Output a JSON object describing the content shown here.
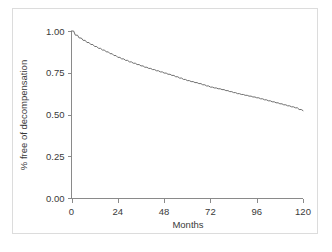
{
  "figure": {
    "background_color": "#ffffff",
    "frame_color": "#dcdcdc",
    "caption_fragment": ""
  },
  "chart_data": {
    "type": "line",
    "title": "",
    "subtitle": "",
    "xlabel": "Months",
    "ylabel": "% free of decompensation",
    "xlim": [
      0,
      120
    ],
    "ylim": [
      0.0,
      1.0
    ],
    "xticks": [
      0,
      24,
      48,
      72,
      96,
      120
    ],
    "xtick_labels": [
      "0",
      "24",
      "48",
      "72",
      "96",
      "120"
    ],
    "yticks": [
      0.0,
      0.25,
      0.5,
      0.75,
      1.0
    ],
    "ytick_labels": [
      "0.00",
      "0.25",
      "0.50",
      "0.75",
      "1.00"
    ],
    "grid": false,
    "legend": false,
    "legend_position": "none",
    "line_color": "#6e6e6e",
    "line_width": 1,
    "series": [
      {
        "name": "Free of decompensation",
        "x": [
          0,
          2,
          4,
          6,
          8,
          10,
          12,
          14,
          16,
          18,
          20,
          22,
          24,
          26,
          28,
          30,
          32,
          34,
          36,
          38,
          40,
          42,
          44,
          46,
          48,
          50,
          52,
          54,
          56,
          58,
          60,
          62,
          64,
          66,
          68,
          70,
          72,
          74,
          76,
          78,
          80,
          82,
          84,
          86,
          88,
          90,
          92,
          94,
          96,
          98,
          100,
          102,
          104,
          106,
          108,
          110,
          112,
          114,
          116,
          118,
          120
        ],
        "values": [
          1.0,
          0.975,
          0.958,
          0.944,
          0.931,
          0.919,
          0.907,
          0.896,
          0.886,
          0.875,
          0.864,
          0.853,
          0.842,
          0.833,
          0.824,
          0.815,
          0.807,
          0.799,
          0.791,
          0.783,
          0.776,
          0.769,
          0.762,
          0.755,
          0.748,
          0.741,
          0.734,
          0.726,
          0.718,
          0.71,
          0.703,
          0.697,
          0.691,
          0.685,
          0.678,
          0.671,
          0.664,
          0.659,
          0.654,
          0.649,
          0.643,
          0.637,
          0.631,
          0.625,
          0.62,
          0.615,
          0.61,
          0.605,
          0.6,
          0.594,
          0.588,
          0.582,
          0.576,
          0.57,
          0.564,
          0.558,
          0.552,
          0.546,
          0.54,
          0.53,
          0.523
        ]
      }
    ]
  }
}
